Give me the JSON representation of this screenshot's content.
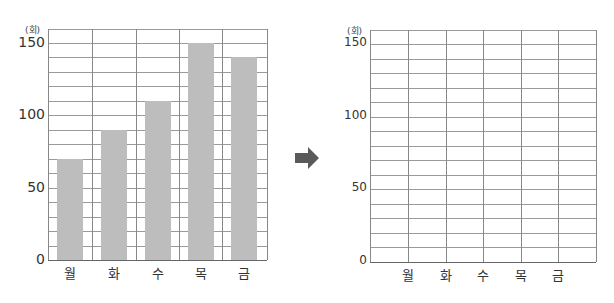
{
  "unit_label": "(회)",
  "chart_data": [
    {
      "type": "bar",
      "title": "",
      "xlabel": "",
      "ylabel": "(회)",
      "categories": [
        "월",
        "화",
        "수",
        "목",
        "금"
      ],
      "values": [
        70,
        90,
        110,
        150,
        140
      ],
      "ylim": [
        0,
        155
      ],
      "yticks": [
        0,
        50,
        100,
        150
      ],
      "grid": true,
      "grid_step": 10,
      "bar_color": "#bdbdbd"
    },
    {
      "type": "line",
      "title": "",
      "xlabel": "",
      "ylabel": "(회)",
      "categories": [
        "월",
        "화",
        "수",
        "목",
        "금"
      ],
      "values": [],
      "ylim": [
        0,
        155
      ],
      "yticks": [
        0,
        50,
        100,
        150
      ],
      "grid": true,
      "grid_step": 10,
      "note": "empty grid to be filled"
    }
  ],
  "arrow": {
    "icon": "right-arrow-icon",
    "color": "#555555"
  }
}
